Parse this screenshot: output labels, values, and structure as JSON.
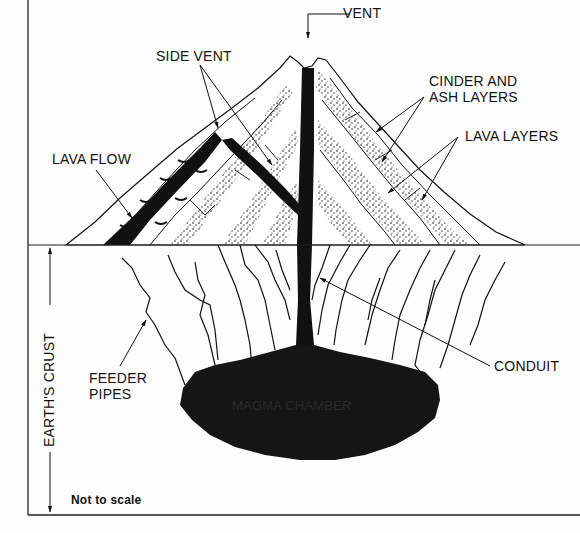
{
  "diagram": {
    "type": "labeled cross-section",
    "colors": {
      "ink": "#111111",
      "background": "#fdfdfd",
      "magma": "#151515"
    },
    "labels": {
      "vent": "VENT",
      "side_vent": "SIDE VENT",
      "cinder_ash_line1": "CINDER AND",
      "cinder_ash_line2": "ASH LAYERS",
      "lava_layers": "LAVA LAYERS",
      "lava_flow": "LAVA FLOW",
      "earths_crust": "EARTH'S CRUST",
      "feeder_line1": "FEEDER",
      "feeder_line2": "PIPES",
      "conduit": "CONDUIT",
      "magma_chamber": "MAGMA CHAMBER",
      "note": "Not to scale"
    }
  }
}
